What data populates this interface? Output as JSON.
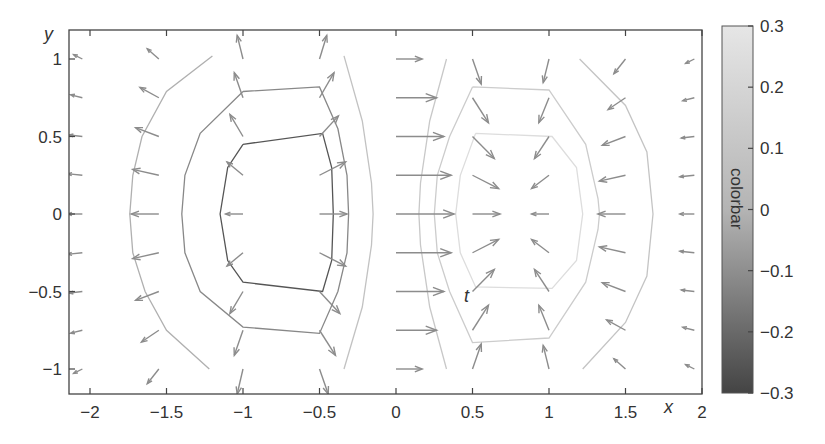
{
  "chart_data": {
    "type": "quiver+contour",
    "title": "",
    "xlabel": "x",
    "ylabel": "y",
    "annotation": "t",
    "xlim": [
      -2.15,
      2.0
    ],
    "ylim": [
      -1.15,
      1.2
    ],
    "x_ticks": [
      -2,
      -1.5,
      -1,
      -0.5,
      0,
      0.5,
      1,
      1.5,
      2
    ],
    "x_tick_labels": [
      "−2",
      "−1.5",
      "−1",
      "−0.5",
      "0",
      "0.5",
      "1",
      "1.5",
      "2"
    ],
    "y_ticks": [
      1,
      0.5,
      0,
      -0.5,
      -1
    ],
    "y_tick_labels": [
      "1",
      "0.5",
      "0",
      "−0.5",
      "−1"
    ],
    "grid": false,
    "colorbar": {
      "label": "colorbar",
      "range": [
        -0.3,
        0.3
      ],
      "ticks": [
        0.3,
        0.2,
        0.1,
        0,
        -0.1,
        -0.2,
        -0.3
      ],
      "tick_labels": [
        "0.3",
        "0.2",
        "0.1",
        "0",
        "−0.1",
        "−0.2",
        "−0.3"
      ],
      "colormap": "gray",
      "color_low": "#444444",
      "color_high": "#e6e6e6"
    },
    "quiver_grid": {
      "x": [
        -2.05,
        -1.55,
        -1.0,
        -0.5,
        0.0,
        0.5,
        1.0,
        1.5,
        1.95
      ],
      "y": [
        1.0,
        0.75,
        0.5,
        0.25,
        0.0,
        -0.25,
        -0.5,
        -0.75,
        -1.0
      ]
    },
    "vectors": [
      {
        "x": -2.05,
        "y": 1.0,
        "u": -0.06,
        "v": 0.03
      },
      {
        "x": -2.05,
        "y": 0.75,
        "u": -0.08,
        "v": 0.02
      },
      {
        "x": -2.05,
        "y": 0.5,
        "u": -0.09,
        "v": 0.01
      },
      {
        "x": -2.05,
        "y": 0.25,
        "u": -0.1,
        "v": 0.01
      },
      {
        "x": -2.05,
        "y": 0.0,
        "u": -0.1,
        "v": 0.0
      },
      {
        "x": -2.05,
        "y": -0.25,
        "u": -0.1,
        "v": -0.01
      },
      {
        "x": -2.05,
        "y": -0.5,
        "u": -0.09,
        "v": -0.01
      },
      {
        "x": -2.05,
        "y": -0.75,
        "u": -0.08,
        "v": -0.02
      },
      {
        "x": -2.05,
        "y": -1.0,
        "u": -0.06,
        "v": -0.03
      },
      {
        "x": -1.55,
        "y": 1.0,
        "u": -0.08,
        "v": 0.07
      },
      {
        "x": -1.55,
        "y": 0.75,
        "u": -0.13,
        "v": 0.07
      },
      {
        "x": -1.55,
        "y": 0.5,
        "u": -0.16,
        "v": 0.06
      },
      {
        "x": -1.55,
        "y": 0.25,
        "u": -0.18,
        "v": 0.04
      },
      {
        "x": -1.55,
        "y": 0.0,
        "u": -0.19,
        "v": 0.0
      },
      {
        "x": -1.55,
        "y": -0.25,
        "u": -0.18,
        "v": -0.04
      },
      {
        "x": -1.55,
        "y": -0.5,
        "u": -0.16,
        "v": -0.06
      },
      {
        "x": -1.55,
        "y": -0.75,
        "u": -0.12,
        "v": -0.08
      },
      {
        "x": -1.55,
        "y": -1.0,
        "u": -0.08,
        "v": -0.1
      },
      {
        "x": -1.0,
        "y": 1.0,
        "u": -0.04,
        "v": 0.16
      },
      {
        "x": -1.0,
        "y": 0.75,
        "u": -0.06,
        "v": 0.17
      },
      {
        "x": -1.0,
        "y": 0.5,
        "u": -0.09,
        "v": 0.15
      },
      {
        "x": -1.0,
        "y": 0.25,
        "u": -0.11,
        "v": 0.09
      },
      {
        "x": -1.0,
        "y": 0.0,
        "u": -0.12,
        "v": 0.0
      },
      {
        "x": -1.0,
        "y": -0.25,
        "u": -0.11,
        "v": -0.09
      },
      {
        "x": -1.0,
        "y": -0.5,
        "u": -0.09,
        "v": -0.15
      },
      {
        "x": -1.0,
        "y": -0.75,
        "u": -0.06,
        "v": -0.17
      },
      {
        "x": -1.0,
        "y": -1.0,
        "u": -0.04,
        "v": -0.17
      },
      {
        "x": -0.5,
        "y": 1.0,
        "u": 0.05,
        "v": 0.16
      },
      {
        "x": -0.5,
        "y": 0.75,
        "u": 0.1,
        "v": 0.17
      },
      {
        "x": -0.5,
        "y": 0.5,
        "u": 0.13,
        "v": 0.14
      },
      {
        "x": -0.5,
        "y": 0.25,
        "u": 0.18,
        "v": 0.09
      },
      {
        "x": -0.5,
        "y": 0.0,
        "u": 0.19,
        "v": 0.0
      },
      {
        "x": -0.5,
        "y": -0.25,
        "u": 0.18,
        "v": -0.09
      },
      {
        "x": -0.5,
        "y": -0.5,
        "u": 0.14,
        "v": -0.15
      },
      {
        "x": -0.5,
        "y": -0.75,
        "u": 0.11,
        "v": -0.17
      },
      {
        "x": -0.5,
        "y": -1.0,
        "u": 0.06,
        "v": -0.17
      },
      {
        "x": 0.0,
        "y": 1.0,
        "u": 0.18,
        "v": 0.0
      },
      {
        "x": 0.0,
        "y": 0.75,
        "u": 0.28,
        "v": 0.0
      },
      {
        "x": 0.0,
        "y": 0.5,
        "u": 0.33,
        "v": 0.0
      },
      {
        "x": 0.0,
        "y": 0.25,
        "u": 0.38,
        "v": 0.0
      },
      {
        "x": 0.0,
        "y": 0.0,
        "u": 0.4,
        "v": 0.0
      },
      {
        "x": 0.0,
        "y": -0.25,
        "u": 0.38,
        "v": 0.0
      },
      {
        "x": 0.0,
        "y": -0.5,
        "u": 0.33,
        "v": 0.0
      },
      {
        "x": 0.0,
        "y": -0.75,
        "u": 0.28,
        "v": 0.0
      },
      {
        "x": 0.0,
        "y": -1.0,
        "u": 0.18,
        "v": 0.0
      },
      {
        "x": 0.5,
        "y": 1.0,
        "u": 0.06,
        "v": -0.17
      },
      {
        "x": 0.5,
        "y": 0.75,
        "u": 0.11,
        "v": -0.17
      },
      {
        "x": 0.5,
        "y": 0.5,
        "u": 0.15,
        "v": -0.15
      },
      {
        "x": 0.5,
        "y": 0.25,
        "u": 0.18,
        "v": -0.09
      },
      {
        "x": 0.5,
        "y": 0.0,
        "u": 0.19,
        "v": 0.0
      },
      {
        "x": 0.5,
        "y": -0.25,
        "u": 0.18,
        "v": 0.09
      },
      {
        "x": 0.5,
        "y": -0.5,
        "u": 0.15,
        "v": 0.15
      },
      {
        "x": 0.5,
        "y": -0.75,
        "u": 0.11,
        "v": 0.17
      },
      {
        "x": 0.5,
        "y": -1.0,
        "u": 0.06,
        "v": 0.17
      },
      {
        "x": 1.0,
        "y": 1.0,
        "u": -0.04,
        "v": -0.16
      },
      {
        "x": 1.0,
        "y": 0.75,
        "u": -0.07,
        "v": -0.17
      },
      {
        "x": 1.0,
        "y": 0.5,
        "u": -0.1,
        "v": -0.15
      },
      {
        "x": 1.0,
        "y": 0.25,
        "u": -0.12,
        "v": -0.09
      },
      {
        "x": 1.0,
        "y": 0.0,
        "u": -0.12,
        "v": 0.0
      },
      {
        "x": 1.0,
        "y": -0.25,
        "u": -0.12,
        "v": 0.09
      },
      {
        "x": 1.0,
        "y": -0.5,
        "u": -0.1,
        "v": 0.15
      },
      {
        "x": 1.0,
        "y": -0.75,
        "u": -0.07,
        "v": 0.17
      },
      {
        "x": 1.0,
        "y": -1.0,
        "u": -0.04,
        "v": 0.16
      },
      {
        "x": 1.5,
        "y": 1.0,
        "u": -0.08,
        "v": -0.1
      },
      {
        "x": 1.5,
        "y": 0.75,
        "u": -0.12,
        "v": -0.08
      },
      {
        "x": 1.5,
        "y": 0.5,
        "u": -0.16,
        "v": -0.06
      },
      {
        "x": 1.5,
        "y": 0.25,
        "u": -0.18,
        "v": -0.04
      },
      {
        "x": 1.5,
        "y": 0.0,
        "u": -0.19,
        "v": 0.0
      },
      {
        "x": 1.5,
        "y": -0.25,
        "u": -0.18,
        "v": 0.04
      },
      {
        "x": 1.5,
        "y": -0.5,
        "u": -0.16,
        "v": 0.06
      },
      {
        "x": 1.5,
        "y": -0.75,
        "u": -0.13,
        "v": 0.07
      },
      {
        "x": 1.5,
        "y": -1.0,
        "u": -0.08,
        "v": 0.07
      },
      {
        "x": 1.95,
        "y": 1.0,
        "u": -0.06,
        "v": -0.03
      },
      {
        "x": 1.95,
        "y": 0.75,
        "u": -0.08,
        "v": -0.02
      },
      {
        "x": 1.95,
        "y": 0.5,
        "u": -0.09,
        "v": -0.01
      },
      {
        "x": 1.95,
        "y": 0.25,
        "u": -0.1,
        "v": -0.01
      },
      {
        "x": 1.95,
        "y": 0.0,
        "u": -0.1,
        "v": 0.0
      },
      {
        "x": 1.95,
        "y": -0.25,
        "u": -0.1,
        "v": 0.01
      },
      {
        "x": 1.95,
        "y": -0.5,
        "u": -0.09,
        "v": 0.01
      },
      {
        "x": 1.95,
        "y": -0.75,
        "u": -0.08,
        "v": 0.02
      },
      {
        "x": 1.95,
        "y": -1.0,
        "u": -0.06,
        "v": 0.03
      }
    ],
    "contours": [
      {
        "level": -0.2,
        "color": "#555555",
        "points": [
          [
            -1.0,
            0.45
          ],
          [
            -0.48,
            0.52
          ],
          [
            -0.42,
            0.3
          ],
          [
            -0.41,
            0.0
          ],
          [
            -0.42,
            -0.3
          ],
          [
            -0.48,
            -0.5
          ],
          [
            -1.0,
            -0.44
          ],
          [
            -1.1,
            -0.3
          ],
          [
            -1.15,
            0.0
          ],
          [
            -1.1,
            0.3
          ],
          [
            -1.0,
            0.45
          ]
        ]
      },
      {
        "level": -0.1,
        "color": "#888888",
        "points": [
          [
            -1.0,
            0.79
          ],
          [
            -0.5,
            0.82
          ],
          [
            -0.38,
            0.55
          ],
          [
            -0.32,
            0.25
          ],
          [
            -0.31,
            0.0
          ],
          [
            -0.32,
            -0.25
          ],
          [
            -0.38,
            -0.5
          ],
          [
            -0.5,
            -0.77
          ],
          [
            -1.0,
            -0.73
          ],
          [
            -1.28,
            -0.5
          ],
          [
            -1.38,
            -0.25
          ],
          [
            -1.4,
            0.0
          ],
          [
            -1.38,
            0.25
          ],
          [
            -1.28,
            0.52
          ],
          [
            -1.0,
            0.79
          ]
        ]
      },
      {
        "level": -0.05,
        "color": "#b0b0b0",
        "points": [
          [
            -1.2,
            1.02
          ],
          [
            -1.5,
            0.79
          ],
          [
            -1.66,
            0.5
          ],
          [
            -1.72,
            0.25
          ],
          [
            -1.74,
            0.0
          ],
          [
            -1.72,
            -0.25
          ],
          [
            -1.64,
            -0.5
          ],
          [
            -1.5,
            -0.75
          ],
          [
            -1.22,
            -1.0
          ]
        ]
      },
      {
        "level": -0.02,
        "color": "#c2c2c2",
        "points": [
          [
            -0.34,
            1.02
          ],
          [
            -0.22,
            0.6
          ],
          [
            -0.16,
            0.2
          ],
          [
            -0.15,
            0.0
          ],
          [
            -0.16,
            -0.2
          ],
          [
            -0.22,
            -0.6
          ],
          [
            -0.34,
            -1.0
          ]
        ]
      },
      {
        "level": 0.02,
        "color": "#c8c8c8",
        "points": [
          [
            0.33,
            1.0
          ],
          [
            0.22,
            0.6
          ],
          [
            0.16,
            0.2
          ],
          [
            0.15,
            0.0
          ],
          [
            0.16,
            -0.2
          ],
          [
            0.22,
            -0.6
          ],
          [
            0.33,
            -1.0
          ]
        ]
      },
      {
        "level": 0.1,
        "color": "#cccccc",
        "points": [
          [
            0.5,
            0.82
          ],
          [
            1.0,
            0.8
          ],
          [
            1.24,
            0.45
          ],
          [
            1.32,
            0.1
          ],
          [
            1.33,
            0.0
          ],
          [
            1.32,
            -0.1
          ],
          [
            1.24,
            -0.44
          ],
          [
            1.0,
            -0.8
          ],
          [
            0.5,
            -0.83
          ],
          [
            0.35,
            -0.5
          ],
          [
            0.27,
            -0.25
          ],
          [
            0.25,
            0.0
          ],
          [
            0.27,
            0.25
          ],
          [
            0.35,
            0.5
          ],
          [
            0.5,
            0.82
          ]
        ]
      },
      {
        "level": 0.2,
        "color": "#dddddd",
        "points": [
          [
            0.52,
            0.52
          ],
          [
            1.02,
            0.5
          ],
          [
            1.18,
            0.3
          ],
          [
            1.22,
            0.0
          ],
          [
            1.18,
            -0.3
          ],
          [
            1.02,
            -0.48
          ],
          [
            0.52,
            -0.47
          ],
          [
            0.42,
            -0.25
          ],
          [
            0.39,
            0.0
          ],
          [
            0.42,
            0.25
          ],
          [
            0.52,
            0.52
          ]
        ]
      },
      {
        "level": 0.05,
        "color": "#c4c4c4",
        "points": [
          [
            1.2,
            1.0
          ],
          [
            1.5,
            0.7
          ],
          [
            1.64,
            0.4
          ],
          [
            1.68,
            0.0
          ],
          [
            1.64,
            -0.4
          ],
          [
            1.5,
            -0.7
          ],
          [
            1.22,
            -1.0
          ]
        ]
      }
    ]
  }
}
